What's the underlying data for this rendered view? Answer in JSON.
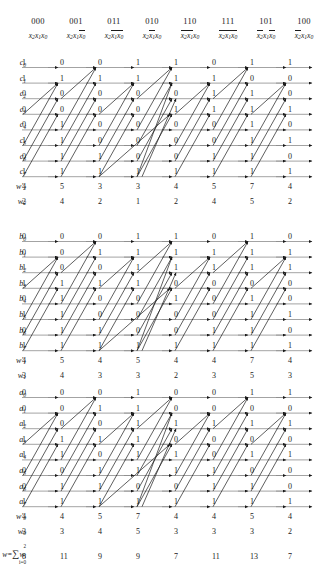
{
  "figure": {
    "columns": [
      {
        "code": "000",
        "vars": [
          {
            "t": "x",
            "s": "2",
            "bar": false
          },
          {
            "t": "x",
            "s": "1",
            "bar": false
          },
          {
            "t": "x",
            "s": "0",
            "bar": false
          }
        ]
      },
      {
        "code": "001",
        "vars": [
          {
            "t": "x",
            "s": "2",
            "bar": false
          },
          {
            "t": "x",
            "s": "1",
            "bar": false
          },
          {
            "t": "x",
            "s": "0",
            "bar": true
          }
        ]
      },
      {
        "code": "011",
        "vars": [
          {
            "t": "x",
            "s": "2",
            "bar": false
          },
          {
            "t": "x",
            "s": "1",
            "bar": true
          },
          {
            "t": "x",
            "s": "0",
            "bar": true
          }
        ]
      },
      {
        "code": "010",
        "vars": [
          {
            "t": "x",
            "s": "2",
            "bar": false
          },
          {
            "t": "x",
            "s": "1",
            "bar": true
          },
          {
            "t": "x",
            "s": "0",
            "bar": false
          }
        ]
      },
      {
        "code": "110",
        "vars": [
          {
            "t": "x",
            "s": "2",
            "bar": true
          },
          {
            "t": "x",
            "s": "1",
            "bar": true
          },
          {
            "t": "x",
            "s": "0",
            "bar": false
          }
        ]
      },
      {
        "code": "111",
        "vars": [
          {
            "t": "x",
            "s": "2",
            "bar": true
          },
          {
            "t": "x",
            "s": "1",
            "bar": true
          },
          {
            "t": "x",
            "s": "0",
            "bar": true
          }
        ]
      },
      {
        "code": "101",
        "vars": [
          {
            "t": "x",
            "s": "2",
            "bar": true
          },
          {
            "t": "x",
            "s": "1",
            "bar": false
          },
          {
            "t": "x",
            "s": "0",
            "bar": true
          }
        ]
      },
      {
        "code": "100",
        "vars": [
          {
            "t": "x",
            "s": "2",
            "bar": true
          },
          {
            "t": "x",
            "s": "1",
            "bar": false
          },
          {
            "t": "x",
            "s": "0",
            "bar": false
          }
        ]
      }
    ],
    "blocks": [
      {
        "id": "block-c",
        "rows": [
          {
            "label": "c",
            "sub": "0",
            "bits": [
              "1",
              "0",
              "0",
              "1",
              "1",
              "0",
              "1",
              "1"
            ]
          },
          {
            "label": "c",
            "sub": "1",
            "bits": [
              "1",
              "1",
              "1",
              "1",
              "1",
              "1",
              "0",
              "0"
            ]
          },
          {
            "label": "c",
            "sub": "2",
            "bits": [
              "0",
              "0",
              "0",
              "0",
              "0",
              "1",
              "1",
              "0"
            ]
          },
          {
            "label": "c",
            "sub": "3",
            "bits": [
              "0",
              "0",
              "0",
              "0",
              "1",
              "1",
              "1",
              "1"
            ]
          },
          {
            "label": "c",
            "sub": "4",
            "bits": [
              "0",
              "1",
              "0",
              "0",
              "0",
              "0",
              "1",
              "0"
            ]
          },
          {
            "label": "c",
            "sub": "5",
            "bits": [
              "1",
              "1",
              "0",
              "0",
              "0",
              "0",
              "1",
              "1"
            ]
          },
          {
            "label": "c",
            "sub": "6",
            "bits": [
              "0",
              "1",
              "1",
              "0",
              "0",
              "1",
              "1",
              "0"
            ]
          },
          {
            "label": "c",
            "sub": "7",
            "bits": [
              "1",
              "1",
              "1",
              "1",
              "1",
              "1",
              "1",
              "1"
            ]
          }
        ],
        "weights": [
          {
            "label": "w",
            "sub": "2",
            "prime": true,
            "values": [
              "4",
              "5",
              "3",
              "3",
              "4",
              "5",
              "7",
              "4"
            ]
          },
          {
            "label": "w",
            "sub": "2",
            "prime": false,
            "values": [
              "2",
              "4",
              "2",
              "1",
              "2",
              "4",
              "5",
              "2"
            ]
          }
        ]
      },
      {
        "id": "block-b",
        "rows": [
          {
            "label": "b",
            "sub": "0",
            "bits": [
              "0",
              "0",
              "0",
              "1",
              "1",
              "0",
              "1",
              "0"
            ]
          },
          {
            "label": "b",
            "sub": "1",
            "bits": [
              "0",
              "0",
              "1",
              "1",
              "1",
              "1",
              "1",
              "1"
            ]
          },
          {
            "label": "b",
            "sub": "2",
            "bits": [
              "1",
              "0",
              "0",
              "1",
              "1",
              "1",
              "1",
              "1"
            ]
          },
          {
            "label": "b",
            "sub": "3",
            "bits": [
              "1",
              "1",
              "1",
              "1",
              "0",
              "0",
              "0",
              "0"
            ]
          },
          {
            "label": "b",
            "sub": "4",
            "bits": [
              "0",
              "1",
              "0",
              "0",
              "1",
              "0",
              "1",
              "0"
            ]
          },
          {
            "label": "b",
            "sub": "5",
            "bits": [
              "1",
              "1",
              "0",
              "0",
              "0",
              "0",
              "1",
              "1"
            ]
          },
          {
            "label": "b",
            "sub": "6",
            "bits": [
              "0",
              "1",
              "1",
              "0",
              "0",
              "1",
              "1",
              "0"
            ]
          },
          {
            "label": "b",
            "sub": "7",
            "bits": [
              "1",
              "1",
              "1",
              "1",
              "1",
              "1",
              "1",
              "1"
            ]
          }
        ],
        "weights": [
          {
            "label": "w",
            "sub": "1",
            "prime": true,
            "values": [
              "4",
              "5",
              "4",
              "5",
              "4",
              "4",
              "7",
              "4"
            ]
          },
          {
            "label": "w",
            "sub": "1",
            "prime": false,
            "values": [
              "3",
              "4",
              "3",
              "3",
              "2",
              "3",
              "5",
              "3"
            ]
          }
        ]
      },
      {
        "id": "block-a",
        "rows": [
          {
            "label": "a",
            "sub": "0",
            "bits": [
              "0",
              "0",
              "0",
              "1",
              "0",
              "0",
              "1",
              "1"
            ]
          },
          {
            "label": "a",
            "sub": "1",
            "bits": [
              "0",
              "0",
              "1",
              "1",
              "0",
              "0",
              "0",
              "0"
            ]
          },
          {
            "label": "a",
            "sub": "2",
            "bits": [
              "1",
              "0",
              "0",
              "1",
              "1",
              "1",
              "1",
              "1"
            ]
          },
          {
            "label": "a",
            "sub": "3",
            "bits": [
              "1",
              "1",
              "1",
              "1",
              "0",
              "0",
              "0",
              "0"
            ]
          },
          {
            "label": "a",
            "sub": "4",
            "bits": [
              "1",
              "1",
              "0",
              "1",
              "1",
              "0",
              "1",
              "1"
            ]
          },
          {
            "label": "a",
            "sub": "5",
            "bits": [
              "0",
              "0",
              "1",
              "1",
              "1",
              "1",
              "0",
              "0"
            ]
          },
          {
            "label": "a",
            "sub": "6",
            "bits": [
              "0",
              "1",
              "1",
              "0",
              "0",
              "1",
              "1",
              "0"
            ]
          },
          {
            "label": "a",
            "sub": "7",
            "bits": [
              "1",
              "1",
              "1",
              "1",
              "1",
              "1",
              "1",
              "1"
            ]
          }
        ],
        "weights": [
          {
            "label": "w",
            "sub": "0",
            "prime": true,
            "values": [
              "4",
              "4",
              "5",
              "7",
              "4",
              "4",
              "5",
              "4"
            ]
          },
          {
            "label": "w",
            "sub": "0",
            "prime": false,
            "values": [
              "3",
              "3",
              "4",
              "5",
              "3",
              "3",
              "3",
              "2"
            ]
          }
        ]
      }
    ],
    "summary": {
      "label_w": "w",
      "label_eq": "=",
      "label_sigma": "∑",
      "label_upper": "2",
      "label_lower": "i=0",
      "label_term": "w",
      "label_term_sub": "i",
      "values": [
        "8",
        "11",
        "9",
        "9",
        "7",
        "11",
        "13",
        "7"
      ]
    }
  }
}
